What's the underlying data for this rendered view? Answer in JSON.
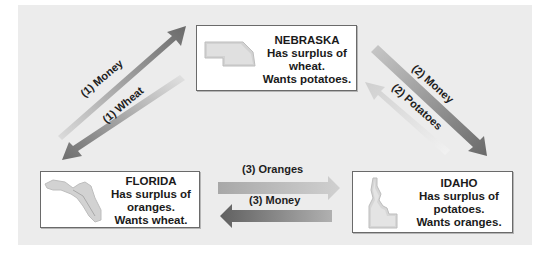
{
  "diagram": {
    "type": "three-way trade cycle",
    "colors": {
      "panel_background": "#ececec",
      "box_background": "#ffffff",
      "box_border": "#6a6a6a",
      "arrow_dark": "#6e6e6e",
      "arrow_light": "#d6d6d6",
      "map_fill": "#d2d2d2"
    },
    "states": {
      "nebraska": {
        "name": "NEBRASKA",
        "line1": "Has surplus of",
        "line2": "wheat.",
        "line3": "Wants potatoes.",
        "icon": "nebraska-map-icon"
      },
      "florida": {
        "name": "FLORIDA",
        "line1": "Has surplus of",
        "line2": "oranges.",
        "line3": "Wants wheat.",
        "icon": "florida-map-icon"
      },
      "idaho": {
        "name": "IDAHO",
        "line1": "Has surplus of",
        "line2": "potatoes.",
        "line3": "Wants oranges.",
        "icon": "idaho-map-icon"
      }
    },
    "arrows": {
      "money_1": {
        "label": "(1) Money",
        "from": "FLORIDA",
        "to": "NEBRASKA"
      },
      "wheat_1": {
        "label": "(1) Wheat",
        "from": "NEBRASKA",
        "to": "FLORIDA"
      },
      "money_2": {
        "label": "(2) Money",
        "from": "NEBRASKA",
        "to": "IDAHO"
      },
      "potatoes_2": {
        "label": "(2) Potatoes",
        "from": "IDAHO",
        "to": "NEBRASKA"
      },
      "oranges_3": {
        "label": "(3) Oranges",
        "from": "FLORIDA",
        "to": "IDAHO"
      },
      "money_3": {
        "label": "(3) Money",
        "from": "IDAHO",
        "to": "FLORIDA"
      }
    }
  }
}
